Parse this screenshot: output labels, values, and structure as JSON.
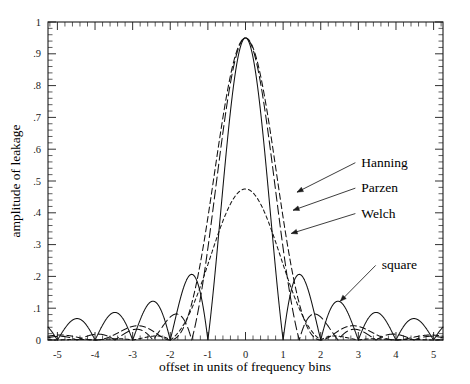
{
  "chart_data": {
    "type": "line",
    "title": "",
    "xlabel": "offset in units of frequency bins",
    "ylabel": "amplitude of leakage",
    "xlim": [
      -5.25,
      5.25
    ],
    "ylim": [
      0,
      1
    ],
    "grid": false,
    "legend_position": "inline-annotations",
    "x_ticks": [
      -5,
      -4,
      -3,
      -2,
      -1,
      0,
      1,
      2,
      3,
      4,
      5
    ],
    "x_tick_labels": [
      "-5",
      "-4",
      "-3",
      "-2",
      "-1",
      "0",
      "1",
      "2",
      "3",
      "4",
      "5"
    ],
    "x_minor_tick_step": 0.2,
    "y_ticks": [
      0,
      0.1,
      0.2,
      0.3,
      0.4,
      0.5,
      0.6,
      0.7,
      0.8,
      0.9,
      1
    ],
    "y_tick_labels": [
      "0",
      ".1",
      ".2",
      ".3",
      ".4",
      ".5",
      ".6",
      ".7",
      ".8",
      ".9",
      "1"
    ],
    "y_minor_tick_step": 0.02,
    "peak_amplitude": 0.95,
    "series": [
      {
        "name": "square",
        "label": "square",
        "linestyle": "solid",
        "dasharray": "",
        "window": "rectangular",
        "peak": 0.95,
        "first_null": 1.0,
        "sidelobe_peaks": [
          0.195,
          0.115,
          0.078,
          0.06,
          0.048
        ],
        "sidelobe_positions": [
          1.5,
          2.5,
          3.5,
          4.5,
          5.5
        ]
      },
      {
        "name": "Welch",
        "label": "Welch",
        "linestyle": "long-dash",
        "dasharray": "9,4",
        "window": "welch-parabolic",
        "peak": 0.95,
        "first_null": 1.45,
        "sidelobe_peaks": [
          0.065,
          0.022,
          0.012
        ],
        "sidelobe_positions": [
          1.85,
          2.85,
          3.85
        ]
      },
      {
        "name": "Parzen",
        "label": "Parzen",
        "linestyle": "medium-dash",
        "dasharray": "6,3.5",
        "window": "parzen-triangular",
        "peak": 0.95,
        "first_null": 1.6,
        "sidelobe_peaks": [
          0.045,
          0.016,
          0.009
        ],
        "sidelobe_positions": [
          2.1,
          3.1,
          4.1
        ]
      },
      {
        "name": "Hanning",
        "label": "Hanning",
        "linestyle": "short-dash",
        "dasharray": "3.5,3",
        "window": "hanning-cosine",
        "peak": 0.95,
        "first_null": 1.75,
        "sidelobe_peaks": [
          0.028,
          0.01,
          0.005
        ],
        "sidelobe_positions": [
          2.4,
          3.4,
          4.4
        ]
      }
    ],
    "annotations": [
      {
        "text": "Hanning",
        "text_x": 3.08,
        "text_y": 0.545,
        "target_x": 1.37,
        "target_y": 0.465
      },
      {
        "text": "Parzen",
        "text_x": 3.08,
        "text_y": 0.465,
        "target_x": 1.265,
        "target_y": 0.408
      },
      {
        "text": "Welch",
        "text_x": 3.08,
        "text_y": 0.385,
        "target_x": 1.215,
        "target_y": 0.335
      },
      {
        "text": "square",
        "text_x": 3.62,
        "text_y": 0.222,
        "target_x": 2.52,
        "target_y": 0.122
      }
    ]
  },
  "axes": {
    "x_title": "offset in units of frequency bins",
    "y_title": "amplitude of leakage"
  }
}
